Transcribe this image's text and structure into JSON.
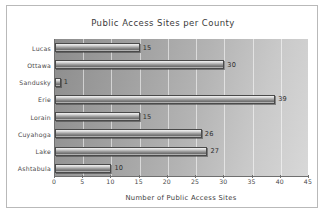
{
  "chart_data": {
    "type": "bar",
    "orientation": "horizontal",
    "title": "Public Access Sites per County",
    "xlabel": "Number of Public Access Sites",
    "ylabel": "",
    "categories": [
      "Lucas",
      "Ottawa",
      "Sandusky",
      "Erie",
      "Lorain",
      "Cuyahoga",
      "Lake",
      "Ashtabula"
    ],
    "values": [
      15,
      30,
      1,
      39,
      15,
      26,
      27,
      10
    ],
    "value_labels": [
      "15",
      "30",
      "1",
      "39",
      "15",
      "26",
      "27",
      "10"
    ],
    "xlim": [
      0,
      45
    ],
    "xticks": [
      0,
      5,
      10,
      15,
      20,
      25,
      30,
      35,
      40,
      45
    ],
    "xtick_labels": [
      "0",
      "5",
      "10",
      "15",
      "20",
      "25",
      "30",
      "35",
      "40",
      "45"
    ],
    "grid": true,
    "grid_axis": "x",
    "legend": false,
    "bar_color": "#9d9d9d",
    "plot_background": "#a8a8a8",
    "page_background": "#ffffff",
    "axis_color": "#6f6f6f",
    "text_color": "#3d3d3d"
  }
}
